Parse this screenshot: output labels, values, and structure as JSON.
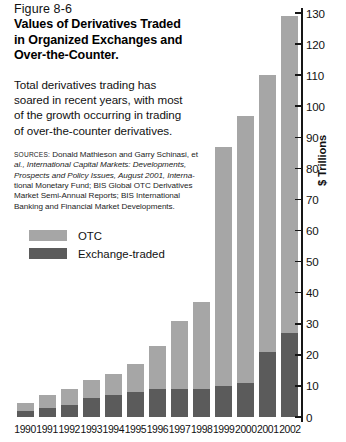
{
  "figure": {
    "number": "Figure 8-6",
    "title_lines": [
      "Values of Derivatives Traded",
      "in Organized Exchanges and",
      "Over-the-Counter."
    ],
    "description_lines": [
      "Total derivatives trading has",
      "soared in recent years, with most",
      "of the growth occurring in trading",
      "of over-the-counter derivatives."
    ],
    "sources_label": "SOURCES:",
    "sources_lines": [
      "Donald Mathieson and Garry Schinasi, et",
      "al., International Capital Markets: Developments,",
      "Prospects and Policy Issues, August 2001, Interna-",
      "tional Monetary Fund; BIS Global OTC Derivatives",
      "Market Semi-Annual Reports; BIS International",
      "Banking and Financial Market Developments."
    ]
  },
  "legend": {
    "items": [
      {
        "label": "OTC",
        "color": "#a6a6a6"
      },
      {
        "label": "Exchange-traded",
        "color": "#5b5b5b"
      }
    ]
  },
  "colors": {
    "otc": "#a6a6a6",
    "exchange_traded": "#5b5b5b",
    "axis": "#161616",
    "background": "#ffffff"
  },
  "chart_data": {
    "type": "bar",
    "stacked": true,
    "title": "Values of Derivatives Traded in Organized Exchanges and Over-the-Counter.",
    "xlabel": "",
    "ylabel": "$ Trillions",
    "ylim": [
      0,
      130
    ],
    "ytick_step": 10,
    "yticks": [
      0,
      10,
      20,
      30,
      40,
      50,
      60,
      70,
      80,
      90,
      100,
      110,
      120,
      130
    ],
    "grid": false,
    "legend_position": "upper-left-outside",
    "categories": [
      "1990",
      "1991",
      "1992",
      "1993",
      "1994",
      "1995",
      "1996",
      "1997",
      "1998",
      "1999",
      "2000",
      "2001",
      "2002"
    ],
    "series": [
      {
        "name": "Exchange-traded",
        "color": "#5b5b5b",
        "values": [
          2,
          3,
          4,
          6,
          7,
          8,
          9,
          9,
          9,
          10,
          11,
          21,
          27
        ]
      },
      {
        "name": "OTC",
        "color": "#a6a6a6",
        "values": [
          2.5,
          4,
          5,
          6,
          7,
          9,
          14,
          22,
          28,
          77,
          86,
          89,
          102
        ]
      }
    ],
    "totals": [
      4.5,
      7,
      9,
      12,
      14,
      17,
      23,
      31,
      37,
      87,
      97,
      110,
      129
    ]
  }
}
